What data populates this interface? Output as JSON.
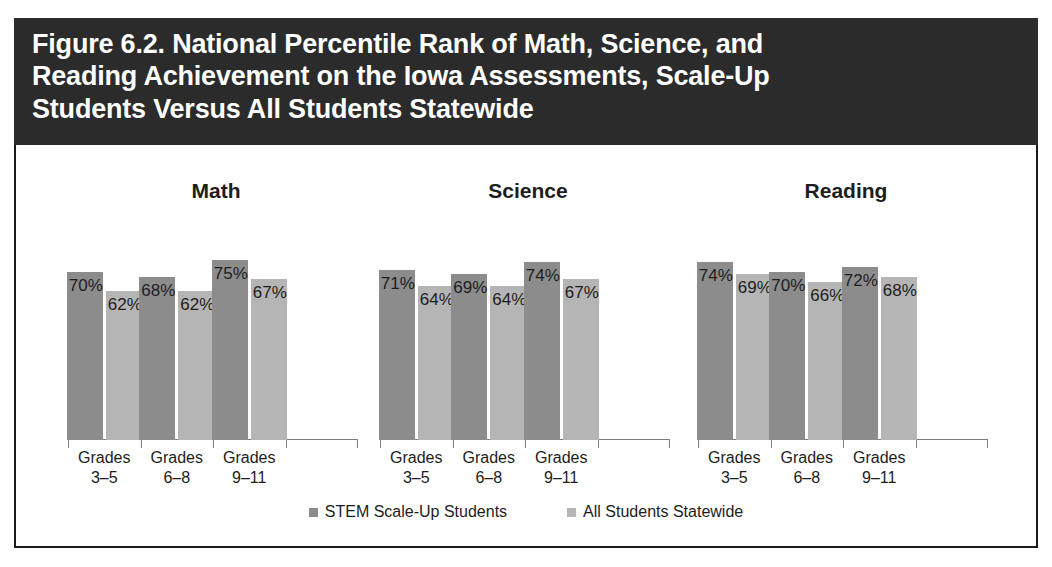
{
  "figure": {
    "title": "Figure 6.2. National Percentile Rank of Math, Science, and\nReading Achievement on the Iowa Assessments, Scale-Up\nStudents Versus All Students Statewide",
    "title_bg": "#2b2b2b",
    "title_color": "#ffffff"
  },
  "legend": {
    "position": "bottom-center",
    "items": [
      {
        "label": "STEM Scale-Up Students",
        "color": "#8c8c8c"
      },
      {
        "label": "All Students Statewide",
        "color": "#b5b5b5"
      }
    ]
  },
  "chart_data": [
    {
      "type": "bar",
      "title": "Math",
      "xlabel": "",
      "ylabel": "",
      "ylim": [
        0,
        100
      ],
      "grid": false,
      "categories": [
        "Grades\n3–5",
        "Grades\n6–8",
        "Grades\n9–11"
      ],
      "series": [
        {
          "name": "STEM Scale-Up Students",
          "color": "#8c8c8c",
          "values": [
            70,
            68,
            75
          ],
          "labels": [
            "70%",
            "68%",
            "75%"
          ]
        },
        {
          "name": "All Students Statewide",
          "color": "#b5b5b5",
          "values": [
            62,
            62,
            67
          ],
          "labels": [
            "62%",
            "62%",
            "67%"
          ]
        }
      ]
    },
    {
      "type": "bar",
      "title": "Science",
      "xlabel": "",
      "ylabel": "",
      "ylim": [
        0,
        100
      ],
      "grid": false,
      "categories": [
        "Grades\n3–5",
        "Grades\n6–8",
        "Grades\n9–11"
      ],
      "series": [
        {
          "name": "STEM Scale-Up Students",
          "color": "#8c8c8c",
          "values": [
            71,
            69,
            74
          ],
          "labels": [
            "71%",
            "69%",
            "74%"
          ]
        },
        {
          "name": "All Students Statewide",
          "color": "#b5b5b5",
          "values": [
            64,
            64,
            67
          ],
          "labels": [
            "64%",
            "64%",
            "67%"
          ]
        }
      ]
    },
    {
      "type": "bar",
      "title": "Reading",
      "xlabel": "",
      "ylabel": "",
      "ylim": [
        0,
        100
      ],
      "grid": false,
      "categories": [
        "Grades\n3–5",
        "Grades\n6–8",
        "Grades\n9–11"
      ],
      "series": [
        {
          "name": "STEM Scale-Up Students",
          "color": "#8c8c8c",
          "values": [
            74,
            70,
            72
          ],
          "labels": [
            "74%",
            "70%",
            "72%"
          ]
        },
        {
          "name": "All Students Statewide",
          "color": "#b5b5b5",
          "values": [
            69,
            66,
            68
          ],
          "labels": [
            "69%",
            "66%",
            "68%"
          ]
        }
      ]
    }
  ]
}
